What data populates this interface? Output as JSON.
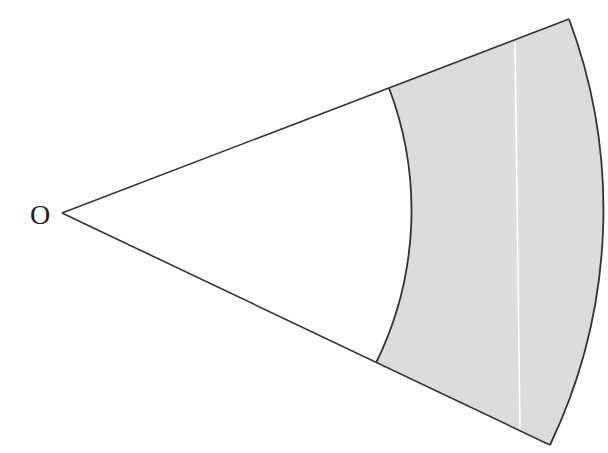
{
  "diagram": {
    "type": "annular-sector",
    "center_label": "O",
    "colors": {
      "shaded_region": "#dcdcdc",
      "stroke": "#333333",
      "divider_line": "#ffffff",
      "background": "#ffffff"
    }
  }
}
